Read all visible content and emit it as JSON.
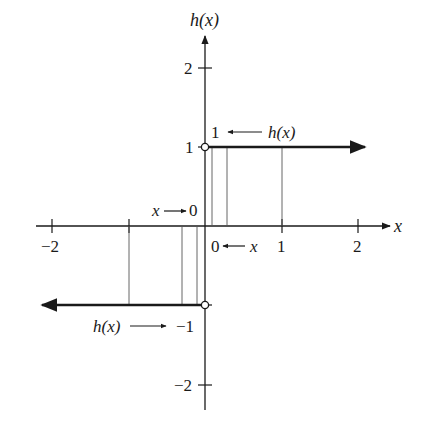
{
  "diagram": {
    "type": "piecewise function graph (sign function)",
    "function_name": "h(x)",
    "axes": {
      "x_label": "x",
      "y_label": "h(x)",
      "x_ticks": [
        "-2",
        "1",
        "2"
      ],
      "x_ticks_values": [
        -2,
        -1,
        1,
        2
      ],
      "y_ticks": [
        "2",
        "1",
        "-2"
      ],
      "y_ticks_values": [
        2,
        1,
        -1,
        -2
      ]
    },
    "pieces": [
      {
        "name": "upper-ray",
        "y": 1,
        "domain": "x > 0",
        "open_endpoint": [
          0,
          1
        ],
        "direction": "right"
      },
      {
        "name": "lower-ray",
        "y": -1,
        "domain": "x < 0",
        "open_endpoint": [
          0,
          -1
        ],
        "direction": "left"
      }
    ],
    "annotations": {
      "upper": {
        "value": "1",
        "arrow": "←",
        "expr": "h(x)"
      },
      "right_limit": {
        "value": "0",
        "arrow": "←",
        "var": "x"
      },
      "left_limit": {
        "var": "x",
        "arrow": "→",
        "value": "0"
      },
      "lower": {
        "expr": "h(x)",
        "arrow": "→",
        "value": "−1"
      }
    },
    "tick_labels": {
      "x_neg2": "−2",
      "x_1": "1",
      "x_2": "2",
      "y_2": "2",
      "y_1": "1",
      "y_neg2": "−2"
    },
    "colors": {
      "ink": "#1a1a1a",
      "guide": "#555555"
    }
  }
}
